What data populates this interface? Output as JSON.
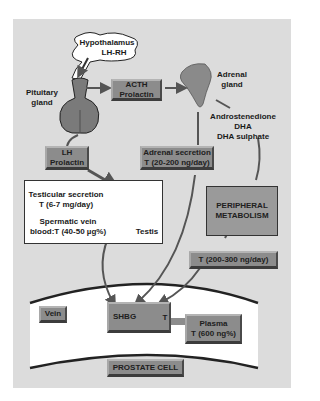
{
  "diagram": {
    "nodes": {
      "hypothalamus": {
        "line1": "Hypothalamus",
        "line2": "LH-RH"
      },
      "pituitary": {
        "line1": "Pituitary",
        "line2": "gland"
      },
      "acth": {
        "line1": "ACTH",
        "line2": "Prolactin"
      },
      "adrenal": {
        "line1": "Adrenal",
        "line2": "gland"
      },
      "adrenal_products": {
        "line1": "Androstenedione",
        "line2": "DHA",
        "line3": "DHA sulphate"
      },
      "lh": {
        "line1": "LH",
        "line2": "Prolactin"
      },
      "adrenal_secretion": {
        "line1": "Adrenal secretion",
        "line2": "T (20-200 ng/day)"
      },
      "testicular": {
        "line1": "Testicular secretion",
        "line2": "T (6-7 mg/day)",
        "line3": "Spermatic vein",
        "line4": "blood:T (40-50 µg%)"
      },
      "testis": {
        "label": "Testis"
      },
      "peripheral": {
        "line1": "PERIPHERAL",
        "line2": "METABOLISM"
      },
      "peripheral_output": {
        "label": "T (200-300 ng/day)"
      },
      "vein": {
        "label": "Vein"
      },
      "shbg": {
        "left": "SHBG",
        "right": "T"
      },
      "plasma": {
        "line1": "Plasma",
        "line2": "T (600 ng%)"
      },
      "prostate": {
        "label": "PROSTATE CELL"
      }
    },
    "colors": {
      "panel": "#dcdcdc",
      "box_fill": "#8c8c8c",
      "peripheral_fill": "#9a9a9a",
      "arrow": "#555555",
      "band": "#ffffff"
    }
  }
}
